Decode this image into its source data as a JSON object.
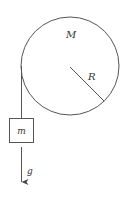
{
  "diagram": {
    "type": "pulley-with-hanging-mass",
    "colors": {
      "stroke": "#555555",
      "text": "#333333",
      "background": "#ffffff"
    },
    "pulley": {
      "label": "M",
      "radius_label": "R"
    },
    "mass": {
      "label": "m"
    },
    "gravity": {
      "label": "g"
    }
  }
}
